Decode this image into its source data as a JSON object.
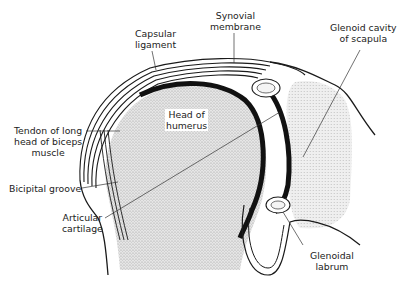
{
  "diagram": {
    "colors": {
      "outline": "#1a1a1a",
      "bone_stipple": "#d2d2d2",
      "cartilage": "#111111",
      "background": "#ffffff"
    },
    "labels": {
      "capsular_ligament": [
        "Capsular",
        "ligament"
      ],
      "synovial_membrane": [
        "Synovial",
        "membrane"
      ],
      "glenoid_cavity": [
        "Glenoid cavity",
        "of scapula"
      ],
      "head_of_humerus": [
        "Head of",
        "humerus"
      ],
      "tendon_biceps": [
        "Tendon of long",
        "head of biceps",
        "muscle"
      ],
      "bicipital_groove": [
        "Bicipital groove"
      ],
      "articular_cartilage": [
        "Articular",
        "cartilage"
      ],
      "glenoidal_labrum": [
        "Glenoidal",
        "labrum"
      ]
    }
  }
}
